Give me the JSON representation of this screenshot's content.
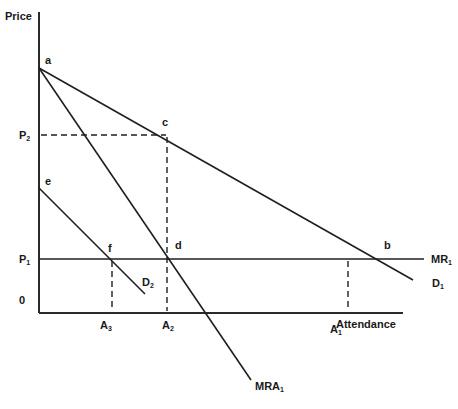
{
  "diagram": {
    "axes": {
      "y_label": "Price",
      "x_label": "Attendance",
      "origin_label": "0"
    },
    "price_ticks": [
      {
        "base": "P",
        "sub": "2"
      },
      {
        "base": "P",
        "sub": "1"
      }
    ],
    "attendance_ticks": [
      {
        "base": "A",
        "sub": "3"
      },
      {
        "base": "A",
        "sub": "2"
      },
      {
        "base": "A",
        "sub": "1"
      }
    ],
    "points": [
      "a",
      "b",
      "c",
      "d",
      "e",
      "f"
    ],
    "curves": [
      {
        "base": "D",
        "sub": "1",
        "description": "Demand curve 1 from a through c and b"
      },
      {
        "base": "MRA",
        "sub": "1",
        "description": "Marginal revenue curve from a through d"
      },
      {
        "base": "MR",
        "sub": "1",
        "description": "Horizontal line at P1"
      },
      {
        "base": "D",
        "sub": "2",
        "description": "Demand curve 2 from e through f"
      }
    ]
  }
}
